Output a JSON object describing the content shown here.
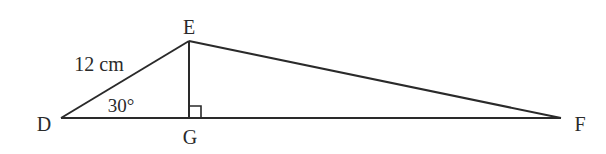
{
  "diagram": {
    "type": "geometry-triangle",
    "vertices": {
      "D": {
        "label": "D"
      },
      "E": {
        "label": "E"
      },
      "F": {
        "label": "F"
      },
      "G": {
        "label": "G"
      }
    },
    "side_label": "12 cm",
    "angle_label": "30°",
    "right_angle_at": "G",
    "line_color": "#2a2a2a"
  }
}
